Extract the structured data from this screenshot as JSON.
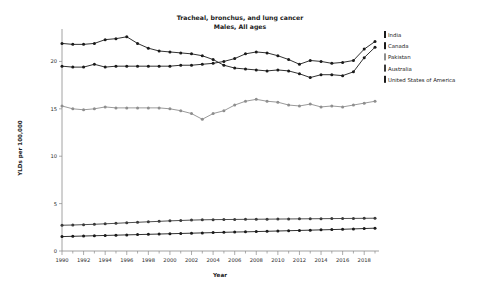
{
  "chart_data": {
    "type": "line",
    "title": "Tracheal, bronchus, and lung cancer",
    "subtitle": "Males, All ages",
    "xlabel": "Year",
    "ylabel": "YLDs per 100,000",
    "xlim": [
      1990,
      2019
    ],
    "ylim": [
      0,
      23
    ],
    "yticks": [
      0,
      5,
      10,
      15,
      20
    ],
    "xticks": [
      1990,
      1992,
      1994,
      1996,
      1998,
      2000,
      2002,
      2004,
      2006,
      2008,
      2010,
      2012,
      2014,
      2016,
      2018
    ],
    "grid": false,
    "legend_position": "right",
    "x": [
      1990,
      1991,
      1992,
      1993,
      1994,
      1995,
      1996,
      1997,
      1998,
      1999,
      2000,
      2001,
      2002,
      2003,
      2004,
      2005,
      2006,
      2007,
      2008,
      2009,
      2010,
      2011,
      2012,
      2013,
      2014,
      2015,
      2016,
      2017,
      2018,
      2019
    ],
    "series": [
      {
        "name": "India",
        "color": "#1a1a1a",
        "values": [
          21.9,
          21.8,
          21.8,
          21.9,
          22.3,
          22.4,
          22.6,
          21.9,
          21.4,
          21.1,
          21.0,
          20.9,
          20.8,
          20.6,
          20.2,
          19.6,
          19.3,
          19.2,
          19.1,
          19.0,
          19.1,
          19.0,
          18.7,
          18.3,
          18.6,
          18.6,
          18.5,
          18.9,
          20.4,
          21.5
        ]
      },
      {
        "name": "Canada",
        "color": "#1a1a1a",
        "values": [
          19.5,
          19.4,
          19.4,
          19.7,
          19.4,
          19.5,
          19.5,
          19.5,
          19.5,
          19.5,
          19.5,
          19.6,
          19.6,
          19.7,
          19.8,
          20.0,
          20.3,
          20.8,
          21.0,
          20.9,
          20.6,
          20.2,
          19.7,
          20.1,
          20.0,
          19.8,
          19.9,
          20.1,
          21.3,
          22.1
        ]
      },
      {
        "name": "Pakistan",
        "color": "#8e8e8e",
        "values": [
          15.3,
          15.0,
          14.9,
          15.0,
          15.2,
          15.1,
          15.1,
          15.1,
          15.1,
          15.1,
          15.0,
          14.8,
          14.5,
          13.9,
          14.5,
          14.8,
          15.4,
          15.8,
          16.0,
          15.8,
          15.7,
          15.4,
          15.3,
          15.5,
          15.2,
          15.3,
          15.2,
          15.4,
          15.6,
          15.8
        ]
      },
      {
        "name": "Australia",
        "color": "#3a3a3a",
        "values": [
          2.72,
          2.74,
          2.78,
          2.82,
          2.87,
          2.92,
          2.98,
          3.03,
          3.08,
          3.13,
          3.18,
          3.22,
          3.26,
          3.29,
          3.31,
          3.32,
          3.33,
          3.34,
          3.35,
          3.36,
          3.37,
          3.38,
          3.39,
          3.4,
          3.41,
          3.42,
          3.43,
          3.44,
          3.45,
          3.46
        ]
      },
      {
        "name": "United States of America",
        "color": "#1a1a1a",
        "values": [
          1.52,
          1.55,
          1.58,
          1.61,
          1.64,
          1.67,
          1.7,
          1.73,
          1.76,
          1.79,
          1.82,
          1.85,
          1.88,
          1.91,
          1.94,
          1.97,
          2.0,
          2.02,
          2.05,
          2.08,
          2.11,
          2.14,
          2.17,
          2.2,
          2.23,
          2.26,
          2.29,
          2.33,
          2.37,
          2.41
        ]
      }
    ]
  },
  "legend": {
    "items": [
      {
        "label": "India",
        "color": "#1a1a1a"
      },
      {
        "label": "Canada",
        "color": "#1a1a1a"
      },
      {
        "label": "Pakistan",
        "color": "#8e8e8e"
      },
      {
        "label": "Australia",
        "color": "#3a3a3a"
      },
      {
        "label": "United States of America",
        "color": "#1a1a1a"
      }
    ]
  }
}
